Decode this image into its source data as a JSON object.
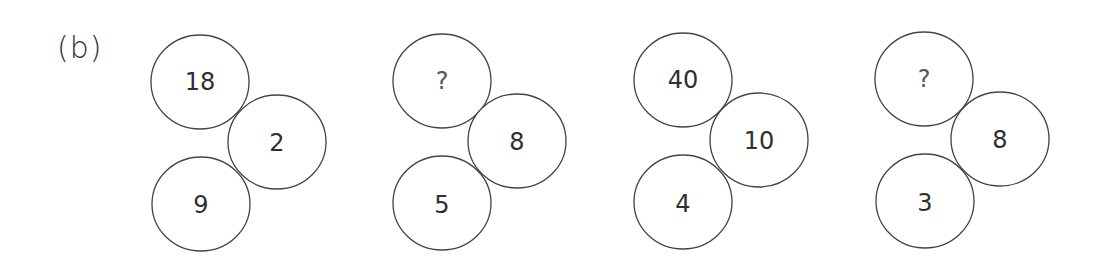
{
  "label": "(b)",
  "puzzles": [
    {
      "top": "18",
      "right": "2",
      "bottom": "9"
    },
    {
      "top": "?",
      "right": "8",
      "bottom": "5"
    },
    {
      "top": "40",
      "right": "10",
      "bottom": "4"
    },
    {
      "top": "?",
      "right": "8",
      "bottom": "3"
    }
  ]
}
